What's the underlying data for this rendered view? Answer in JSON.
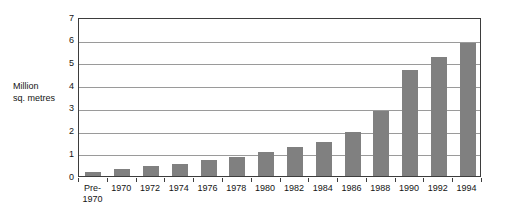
{
  "chart_data": {
    "type": "bar",
    "title": "",
    "xlabel": "",
    "ylabel": "Million\nsq. metres",
    "ylabel_line1": "Million",
    "ylabel_line2": "sq. metres",
    "categories": [
      "Pre-\n1970",
      "1970",
      "1972",
      "1974",
      "1976",
      "1978",
      "1980",
      "1982",
      "1984",
      "1986",
      "1988",
      "1990",
      "1992",
      "1994"
    ],
    "values": [
      0.2,
      0.3,
      0.45,
      0.55,
      0.7,
      0.85,
      1.05,
      1.3,
      1.5,
      1.95,
      2.85,
      4.65,
      5.25,
      5.85
    ],
    "ylim": [
      0,
      7
    ],
    "ytick_labels": [
      "7",
      "6",
      "5",
      "4",
      "3",
      "2",
      "1",
      "0"
    ],
    "ytick_values": [
      7,
      6,
      5,
      4,
      3,
      2,
      1,
      0
    ],
    "ystep": 1,
    "grid": true,
    "legend": "none",
    "bar_color": "#808080",
    "axis_color": "#3d3d3d",
    "grid_color": "#9a9a9a",
    "background_color": "#ffffff"
  }
}
